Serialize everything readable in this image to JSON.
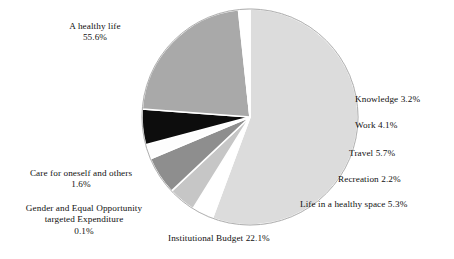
{
  "chart_data": {
    "type": "pie",
    "title": "",
    "subtitle": "",
    "xlabel": "",
    "ylabel": "",
    "legend_position": "none",
    "grid": false,
    "units": "percent",
    "labels": [
      "A healthy life",
      "Knowledge",
      "Work",
      "Travel",
      "Recreation",
      "Life in a healthy space",
      "Institutional Budget",
      "Gender and Equal Opportunity targeted Expenditure",
      "Care for oneself and others"
    ],
    "values": [
      55.6,
      3.2,
      4.1,
      5.7,
      2.2,
      5.3,
      22.1,
      0.1,
      1.6
    ],
    "colors": [
      "#dcdcdc",
      "#ffffff",
      "#c6c6c6",
      "#8e8e8e",
      "#fdfdfd",
      "#0d0d0d",
      "#a9a9a9",
      "#ffffff",
      "#ffffff"
    ],
    "start_angle_deg": 0,
    "direction": "clockwise",
    "slices": [
      {
        "name": "A healthy life",
        "value": 55.6,
        "color": "#dcdcdc"
      },
      {
        "name": "Knowledge",
        "value": 3.2,
        "color": "#ffffff"
      },
      {
        "name": "Work",
        "value": 4.1,
        "color": "#c6c6c6"
      },
      {
        "name": "Travel",
        "value": 5.7,
        "color": "#8e8e8e"
      },
      {
        "name": "Recreation",
        "value": 2.2,
        "color": "#fdfdfd"
      },
      {
        "name": "Life in a healthy space",
        "value": 5.3,
        "color": "#0d0d0d"
      },
      {
        "name": "Institutional Budget",
        "value": 22.1,
        "color": "#a9a9a9"
      },
      {
        "name": "Gender and Equal Opportunity targeted Expenditure",
        "value": 0.1,
        "color": "#ffffff"
      },
      {
        "name": "Care for oneself and others",
        "value": 1.6,
        "color": "#ffffff"
      }
    ]
  },
  "labels": {
    "healthy_life": "A healthy life\n55.6%",
    "knowledge": "Knowledge 3.2%",
    "work": "Work 4.1%",
    "travel": "Travel 5.7%",
    "recreation": "Recreation 2.2%",
    "healthy_space": "Life in a healthy space 5.3%",
    "institutional_budget": "Institutional Budget 22.1%",
    "care_for_oneself": "Care for oneself and others\n1.6%",
    "gender_equal_opportunity": "Gender and Equal Opportunity\ntargeted Expenditure\n0.1%"
  },
  "geometry": {
    "center_x": 250,
    "center_y": 117,
    "radius": 108
  },
  "style": {
    "background": "#ffffff",
    "outline": "#9a9a9a",
    "text_color": "#111111"
  }
}
